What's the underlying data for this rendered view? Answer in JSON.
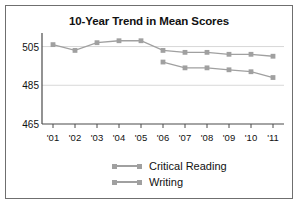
{
  "chart_data": {
    "type": "line",
    "title": "10-Year Trend in Mean Scores",
    "xlabel": "",
    "ylabel": "",
    "categories": [
      "'01",
      "'02",
      "'03",
      "'04",
      "'05",
      "'06",
      "'07",
      "'08",
      "'09",
      "'10",
      "'11"
    ],
    "ylim": [
      465,
      512
    ],
    "yticks": [
      465,
      485,
      505
    ],
    "gridlines": [
      485,
      505
    ],
    "grid": true,
    "legend_position": "bottom",
    "series": [
      {
        "name": "Critical Reading",
        "color": "#a0a0a0",
        "values": [
          506,
          503,
          507,
          508,
          508,
          503,
          502,
          502,
          501,
          501,
          500
        ]
      },
      {
        "name": "Writing",
        "color": "#a0a0a0",
        "values": [
          null,
          null,
          null,
          null,
          null,
          497,
          494,
          494,
          493,
          492,
          489
        ]
      }
    ]
  },
  "legend": {
    "items": [
      {
        "label": "Critical Reading"
      },
      {
        "label": "Writing"
      }
    ]
  }
}
